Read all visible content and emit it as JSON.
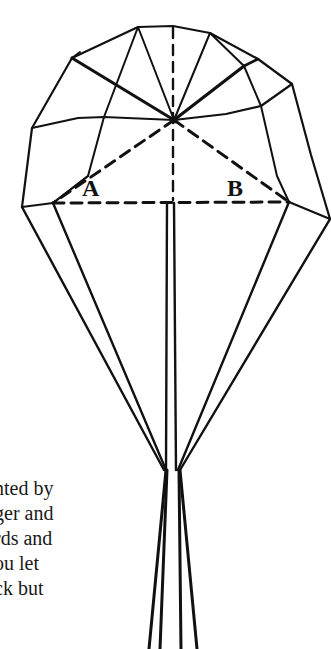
{
  "figure": {
    "labels": {
      "a": "A",
      "b": "B"
    },
    "ink_color": "#111111",
    "background": "#ffffff"
  },
  "text": {
    "lines": [
      "nted by",
      "ger and",
      "rds and",
      "ou let",
      "ck but"
    ]
  }
}
